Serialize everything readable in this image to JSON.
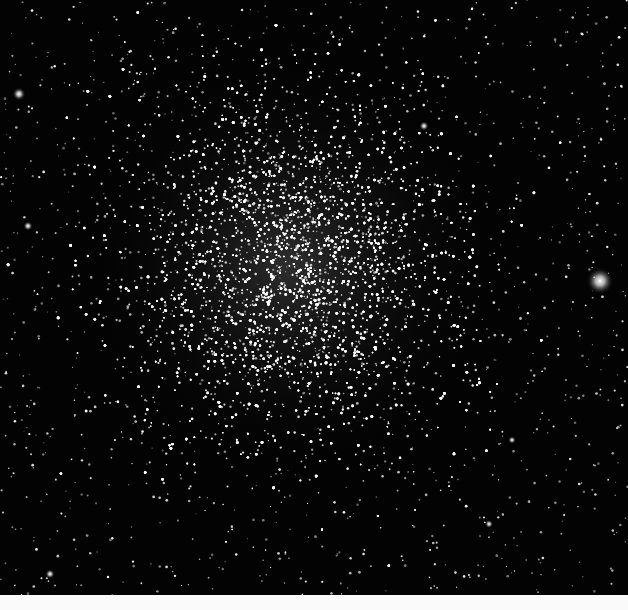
{
  "image": {
    "subject": "Globular star cluster",
    "alt": "Dense globular star cluster against black sky",
    "background_color": "#030303",
    "strip_color": "#fafafa",
    "photo_height": 595,
    "cluster": {
      "center_x": 290,
      "center_y": 265,
      "core_radius": 70,
      "halo_radius": 210,
      "star_count": 9000,
      "glow_color": "rgba(200,200,200,0.22)"
    },
    "field_star_count": 1400,
    "bright_stars": [
      {
        "x": 600,
        "y": 281,
        "r": 4.5
      },
      {
        "x": 19,
        "y": 94,
        "r": 2.2
      },
      {
        "x": 424,
        "y": 126,
        "r": 1.6
      },
      {
        "x": 28,
        "y": 226,
        "r": 1.6
      },
      {
        "x": 50,
        "y": 574,
        "r": 1.6
      },
      {
        "x": 489,
        "y": 524,
        "r": 1.4
      },
      {
        "x": 512,
        "y": 440,
        "r": 1.3
      }
    ]
  }
}
